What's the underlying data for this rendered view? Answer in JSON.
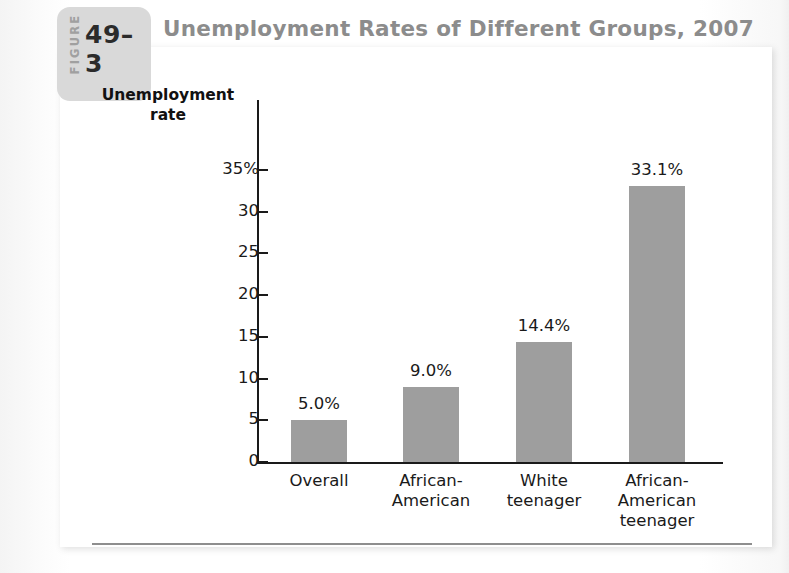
{
  "figure": {
    "label": "FIGURE",
    "number": "49–3",
    "title": "Unemployment Rates of Different Groups, 2007"
  },
  "chart_data": {
    "type": "bar",
    "title": "Unemployment Rates of Different Groups, 2007",
    "xlabel": "",
    "ylabel": "Unemployment rate",
    "ylabel_lines": [
      "Unemployment",
      "rate"
    ],
    "categories": [
      "Overall",
      "African-American",
      "White teenager",
      "African-American teenager"
    ],
    "category_lines": [
      [
        "Overall"
      ],
      [
        "African-",
        "American"
      ],
      [
        "White",
        "teenager"
      ],
      [
        "African-",
        "American",
        "teenager"
      ]
    ],
    "values": [
      5.0,
      9.0,
      14.4,
      33.1
    ],
    "value_labels": [
      "5.0%",
      "9.0%",
      "14.4%",
      "33.1%"
    ],
    "ylim": [
      0,
      35
    ],
    "ytick_values": [
      35,
      30,
      25,
      20,
      15,
      10,
      5,
      0
    ],
    "ytick_labels": [
      "35%",
      "30",
      "25",
      "20",
      "15",
      "10",
      "5",
      "0"
    ],
    "grid": false,
    "legend": false,
    "bar_color": "#9e9e9e",
    "axis_color": "#1a1a1a"
  }
}
